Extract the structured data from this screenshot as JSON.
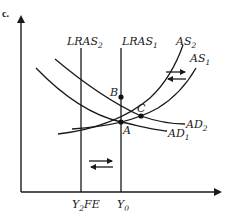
{
  "figure": {
    "part_label": "c.",
    "x_ticks": [
      {
        "main": "Y",
        "sub": "2",
        "suffix": "FE"
      },
      {
        "main": "Y",
        "sub": "0",
        "suffix": ""
      }
    ],
    "vertical_lines": [
      {
        "main": "LRAS",
        "sub": "2"
      },
      {
        "main": "LRAS",
        "sub": "1"
      }
    ],
    "supply_curves": [
      {
        "main": "AS",
        "sub": "2"
      },
      {
        "main": "AS",
        "sub": "1"
      }
    ],
    "demand_curves": [
      {
        "main": "AD",
        "sub": "2"
      },
      {
        "main": "AD",
        "sub": "1"
      }
    ],
    "points": [
      "A",
      "B",
      "C"
    ],
    "shift_arrows": [
      {
        "location": "between AS1 and AS2",
        "directions": [
          "right",
          "left"
        ]
      },
      {
        "location": "between LRAS2 and LRAS1",
        "directions": [
          "right",
          "left"
        ]
      }
    ],
    "colors": {
      "ink": "#1a1a1a",
      "background": "#ffffff"
    }
  }
}
